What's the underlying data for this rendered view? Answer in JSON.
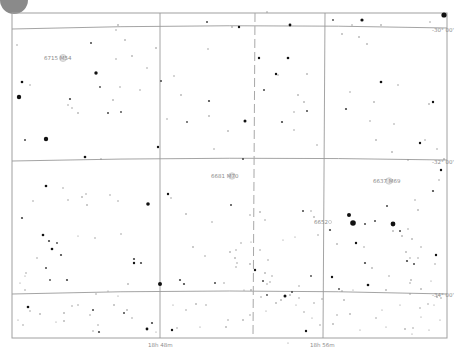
{
  "chart": {
    "title": "",
    "frame": {
      "x": 12,
      "y": 13,
      "width": 435,
      "height": 325
    },
    "colors": {
      "background": "#ffffff",
      "grid": "#9a9a9a",
      "star": "#111111",
      "label": "#8c8c8c"
    }
  },
  "chart_data": {
    "type": "scatter",
    "xlabel": "Right Ascension",
    "ylabel": "Declination",
    "ra_ticks": [
      {
        "label": "18h 48m",
        "x": 160
      },
      {
        "label": "18h 56m",
        "x": 323
      }
    ],
    "dec_ticks": [
      {
        "label": "-30° 00'",
        "y": 28
      },
      {
        "label": "-32° 00'",
        "y": 160
      },
      {
        "label": "-34° 00'",
        "y": 293
      }
    ],
    "objects": [
      {
        "id": "6715",
        "name": "M54",
        "label": "6715 M54",
        "x": 63,
        "y": 58
      },
      {
        "id": "6681",
        "name": "M70",
        "label": "6681 M70",
        "x": 232,
        "y": 176
      },
      {
        "id": "6637",
        "name": "M69",
        "label": "6637 M69",
        "x": 389,
        "y": 181
      },
      {
        "id": "6652",
        "name": "",
        "label": "6652",
        "x": 332,
        "y": 222
      }
    ],
    "grid": true,
    "legend": null
  },
  "labels": {
    "dec_top": "-30° 00'",
    "dec_mid": "-32° 00'",
    "dec_bot": "-34° 00'",
    "ra_left": "18h 48m",
    "ra_right": "18h 56m",
    "m54": "6715 M54",
    "m70": "6681 M70",
    "m69": "6637 M69",
    "ngc6652": "6652"
  },
  "stars": [
    [
      444,
      15,
      2.6
    ],
    [
      362,
      20,
      1.6
    ],
    [
      290,
      25,
      1.4
    ],
    [
      207,
      22,
      1.0
    ],
    [
      267,
      12,
      0.7
    ],
    [
      118,
      25,
      0.8
    ],
    [
      232,
      27,
      0.8
    ],
    [
      333,
      20,
      0.9
    ],
    [
      381,
      25,
      0.8
    ],
    [
      430,
      22,
      0.7
    ],
    [
      342,
      34,
      0.8
    ],
    [
      19,
      97,
      2.2
    ],
    [
      46,
      139,
      2.2
    ],
    [
      96,
      73,
      1.7
    ],
    [
      22,
      82,
      1.3
    ],
    [
      30,
      85,
      0.7
    ],
    [
      70,
      99,
      1.1
    ],
    [
      68,
      105,
      0.7
    ],
    [
      100,
      87,
      0.9
    ],
    [
      120,
      87,
      0.7
    ],
    [
      113,
      100,
      0.8
    ],
    [
      140,
      90,
      0.7
    ],
    [
      108,
      113,
      1.0
    ],
    [
      78,
      113,
      0.8
    ],
    [
      72,
      108,
      0.7
    ],
    [
      25,
      140,
      1.0
    ],
    [
      101,
      159,
      0.7
    ],
    [
      85,
      157,
      1.3
    ],
    [
      158,
      147,
      1.2
    ],
    [
      121,
      112,
      0.9
    ],
    [
      91,
      43,
      1.0
    ],
    [
      116,
      30,
      0.7
    ],
    [
      125,
      40,
      0.8
    ],
    [
      17,
      45,
      0.7
    ],
    [
      132,
      56,
      0.8
    ],
    [
      116,
      59,
      0.7
    ],
    [
      147,
      68,
      0.7
    ],
    [
      156,
      48,
      0.8
    ],
    [
      174,
      76,
      0.7
    ],
    [
      181,
      95,
      0.8
    ],
    [
      161,
      81,
      1.0
    ],
    [
      167,
      119,
      0.7
    ],
    [
      209,
      116,
      0.8
    ],
    [
      209,
      101,
      1.1
    ],
    [
      187,
      122,
      0.9
    ],
    [
      245,
      121,
      1.5
    ],
    [
      228,
      131,
      0.8
    ],
    [
      214,
      149,
      0.7
    ],
    [
      239,
      27,
      1.2
    ],
    [
      208,
      49,
      0.7
    ],
    [
      259,
      58,
      1.2
    ],
    [
      288,
      58,
      1.3
    ],
    [
      276,
      74,
      1.2
    ],
    [
      307,
      74,
      0.8
    ],
    [
      264,
      90,
      1.0
    ],
    [
      278,
      75,
      0.7
    ],
    [
      304,
      102,
      0.8
    ],
    [
      307,
      111,
      1.0
    ],
    [
      294,
      112,
      0.7
    ],
    [
      298,
      95,
      0.8
    ],
    [
      282,
      122,
      1.1
    ],
    [
      294,
      130,
      0.7
    ],
    [
      317,
      145,
      0.7
    ],
    [
      243,
      159,
      1.0
    ],
    [
      352,
      25,
      0.7
    ],
    [
      359,
      37,
      0.8
    ],
    [
      367,
      44,
      0.8
    ],
    [
      381,
      82,
      1.3
    ],
    [
      398,
      85,
      0.7
    ],
    [
      346,
      109,
      1.1
    ],
    [
      374,
      102,
      0.8
    ],
    [
      370,
      121,
      0.7
    ],
    [
      433,
      102,
      1.2
    ],
    [
      429,
      104,
      0.8
    ],
    [
      350,
      92,
      0.7
    ],
    [
      376,
      140,
      0.8
    ],
    [
      394,
      124,
      0.7
    ],
    [
      420,
      143,
      1.2
    ],
    [
      425,
      140,
      0.7
    ],
    [
      437,
      149,
      0.7
    ],
    [
      392,
      152,
      0.8
    ],
    [
      408,
      160,
      0.7
    ],
    [
      444,
      159,
      0.8
    ],
    [
      441,
      170,
      1.2
    ],
    [
      439,
      180,
      0.7
    ],
    [
      433,
      191,
      1.1
    ],
    [
      387,
      206,
      1.0
    ],
    [
      418,
      210,
      0.8
    ],
    [
      415,
      200,
      0.7
    ],
    [
      393,
      231,
      0.8
    ],
    [
      330,
      230,
      1.1
    ],
    [
      303,
      211,
      1.0
    ],
    [
      318,
      235,
      0.7
    ],
    [
      337,
      244,
      0.8
    ],
    [
      349,
      215,
      2.0
    ],
    [
      353,
      223,
      2.8
    ],
    [
      365,
      224,
      1.0
    ],
    [
      375,
      221,
      1.0
    ],
    [
      393,
      224,
      2.4
    ],
    [
      400,
      231,
      1.0
    ],
    [
      402,
      236,
      0.8
    ],
    [
      408,
      229,
      0.7
    ],
    [
      412,
      239,
      0.8
    ],
    [
      356,
      243,
      1.2
    ],
    [
      364,
      247,
      0.7
    ],
    [
      365,
      263,
      1.1
    ],
    [
      372,
      268,
      0.8
    ],
    [
      389,
      276,
      0.7
    ],
    [
      406,
      252,
      0.8
    ],
    [
      410,
      258,
      0.7
    ],
    [
      407,
      261,
      1.1
    ],
    [
      414,
      264,
      1.0
    ],
    [
      418,
      258,
      0.7
    ],
    [
      436,
      255,
      1.2
    ],
    [
      435,
      264,
      0.7
    ],
    [
      421,
      247,
      0.7
    ],
    [
      411,
      280,
      0.8
    ],
    [
      421,
      289,
      0.8
    ],
    [
      410,
      283,
      0.7
    ],
    [
      431,
      281,
      0.6
    ],
    [
      46,
      186,
      1.3
    ],
    [
      22,
      218,
      1.1
    ],
    [
      33,
      201,
      0.7
    ],
    [
      43,
      235,
      1.3
    ],
    [
      49,
      241,
      1.1
    ],
    [
      52,
      249,
      1.3
    ],
    [
      61,
      255,
      1.1
    ],
    [
      57,
      243,
      0.9
    ],
    [
      46,
      268,
      1.0
    ],
    [
      37,
      258,
      0.7
    ],
    [
      26,
      273,
      0.7
    ],
    [
      68,
      200,
      0.7
    ],
    [
      63,
      188,
      0.7
    ],
    [
      82,
      197,
      0.8
    ],
    [
      86,
      194,
      0.7
    ],
    [
      87,
      205,
      0.8
    ],
    [
      110,
      195,
      0.7
    ],
    [
      118,
      201,
      0.7
    ],
    [
      148,
      204,
      1.8
    ],
    [
      134,
      259,
      1.1
    ],
    [
      134,
      263,
      1.2
    ],
    [
      141,
      263,
      1.1
    ],
    [
      121,
      234,
      0.7
    ],
    [
      95,
      238,
      0.7
    ],
    [
      78,
      236,
      0.6
    ],
    [
      67,
      280,
      1.1
    ],
    [
      50,
      280,
      0.9
    ],
    [
      25,
      276,
      0.6
    ],
    [
      168,
      194,
      1.2
    ],
    [
      171,
      198,
      0.7
    ],
    [
      231,
      205,
      1.0
    ],
    [
      186,
      214,
      0.8
    ],
    [
      193,
      247,
      0.8
    ],
    [
      205,
      256,
      0.7
    ],
    [
      230,
      252,
      0.8
    ],
    [
      236,
      250,
      0.7
    ],
    [
      235,
      258,
      0.8
    ],
    [
      237,
      263,
      0.7
    ],
    [
      236,
      267,
      0.7
    ],
    [
      250,
      264,
      0.8
    ],
    [
      255,
      270,
      1.2
    ],
    [
      265,
      273,
      0.8
    ],
    [
      268,
      260,
      0.7
    ],
    [
      260,
      250,
      0.7
    ],
    [
      241,
      243,
      0.7
    ],
    [
      251,
      242,
      0.6
    ],
    [
      283,
      240,
      0.6
    ],
    [
      295,
      237,
      0.6
    ],
    [
      260,
      212,
      0.8
    ],
    [
      265,
      220,
      0.7
    ],
    [
      250,
      215,
      0.7
    ],
    [
      212,
      222,
      0.7
    ],
    [
      272,
      276,
      0.7
    ],
    [
      270,
      282,
      0.7
    ],
    [
      267,
      284,
      0.7
    ],
    [
      251,
      290,
      0.8
    ],
    [
      261,
      297,
      0.7
    ],
    [
      267,
      295,
      0.9
    ],
    [
      285,
      296,
      1.5
    ],
    [
      290,
      295,
      0.8
    ],
    [
      299,
      286,
      0.7
    ],
    [
      311,
      211,
      0.7
    ],
    [
      314,
      217,
      0.8
    ],
    [
      180,
      280,
      1.1
    ],
    [
      160,
      284,
      2.0
    ],
    [
      184,
      284,
      1.1
    ],
    [
      215,
      283,
      1.0
    ],
    [
      224,
      283,
      0.7
    ],
    [
      263,
      281,
      1.0
    ],
    [
      292,
      292,
      1.0
    ],
    [
      311,
      276,
      0.9
    ],
    [
      332,
      277,
      1.2
    ],
    [
      339,
      289,
      0.9
    ],
    [
      342,
      291,
      0.7
    ],
    [
      368,
      285,
      1.3
    ],
    [
      386,
      290,
      0.8
    ],
    [
      410,
      294,
      0.7
    ],
    [
      344,
      300,
      0.8
    ],
    [
      322,
      299,
      0.7
    ],
    [
      314,
      303,
      0.7
    ],
    [
      299,
      298,
      0.7
    ],
    [
      281,
      300,
      0.8
    ],
    [
      276,
      303,
      0.8
    ],
    [
      250,
      315,
      0.7
    ],
    [
      243,
      320,
      0.8
    ],
    [
      228,
      320,
      0.7
    ],
    [
      226,
      327,
      0.8
    ],
    [
      177,
      328,
      0.7
    ],
    [
      172,
      330,
      1.2
    ],
    [
      147,
      329,
      1.4
    ],
    [
      152,
      323,
      1.1
    ],
    [
      124,
      313,
      1.0
    ],
    [
      127,
      310,
      0.8
    ],
    [
      132,
      318,
      0.7
    ],
    [
      114,
      305,
      0.8
    ],
    [
      96,
      294,
      0.7
    ],
    [
      93,
      310,
      1.0
    ],
    [
      90,
      315,
      0.7
    ],
    [
      78,
      305,
      0.7
    ],
    [
      72,
      306,
      0.7
    ],
    [
      64,
      313,
      0.8
    ],
    [
      64,
      321,
      0.8
    ],
    [
      56,
      322,
      0.6
    ],
    [
      28,
      307,
      1.3
    ],
    [
      30,
      311,
      0.7
    ],
    [
      23,
      325,
      0.7
    ],
    [
      18,
      320,
      0.6
    ],
    [
      98,
      325,
      0.7
    ],
    [
      99,
      332,
      1.1
    ],
    [
      93,
      331,
      0.7
    ],
    [
      40,
      314,
      0.8
    ],
    [
      25,
      290,
      0.7
    ],
    [
      20,
      283,
      0.6
    ],
    [
      128,
      284,
      0.8
    ],
    [
      118,
      296,
      0.6
    ],
    [
      108,
      291,
      0.6
    ],
    [
      288,
      343,
      0.6
    ],
    [
      306,
      331,
      1.2
    ],
    [
      320,
      325,
      0.7
    ],
    [
      333,
      324,
      0.8
    ],
    [
      337,
      315,
      0.7
    ],
    [
      350,
      314,
      0.8
    ],
    [
      376,
      318,
      0.7
    ],
    [
      386,
      327,
      0.6
    ],
    [
      405,
      329,
      0.8
    ],
    [
      413,
      328,
      0.7
    ],
    [
      412,
      334,
      0.6
    ],
    [
      420,
      308,
      0.7
    ],
    [
      428,
      304,
      0.7
    ],
    [
      434,
      305,
      0.6
    ],
    [
      437,
      297,
      0.8
    ],
    [
      441,
      298,
      0.7
    ],
    [
      421,
      317,
      0.6
    ],
    [
      304,
      312,
      0.7
    ],
    [
      296,
      305,
      0.6
    ],
    [
      266,
      311,
      0.6
    ],
    [
      206,
      305,
      0.7
    ],
    [
      196,
      304,
      0.8
    ],
    [
      186,
      310,
      0.7
    ],
    [
      173,
      305,
      0.6
    ],
    [
      353,
      290,
      0.6
    ],
    [
      400,
      305,
      0.6
    ],
    [
      429,
      330,
      0.6
    ],
    [
      440,
      320,
      0.6
    ],
    [
      156,
      332,
      0.6
    ],
    [
      200,
      327,
      0.6
    ],
    [
      244,
      290,
      0.6
    ],
    [
      312,
      318,
      0.6
    ],
    [
      382,
      310,
      0.6
    ],
    [
      360,
      330,
      0.6
    ]
  ]
}
